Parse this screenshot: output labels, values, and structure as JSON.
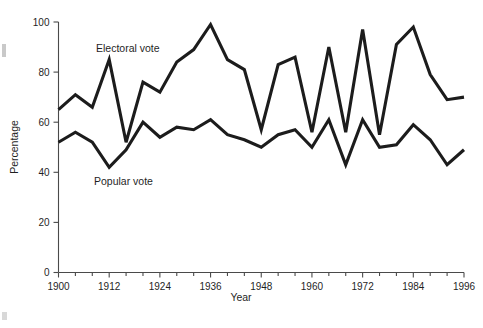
{
  "chart_data": {
    "type": "line",
    "title": "",
    "xlabel": "Year",
    "ylabel": "Percentage",
    "xlim": [
      1900,
      1996
    ],
    "ylim": [
      0,
      100
    ],
    "grid": false,
    "legend_position": "inline-annotation",
    "x": [
      1900,
      1904,
      1908,
      1912,
      1916,
      1920,
      1924,
      1928,
      1932,
      1936,
      1940,
      1944,
      1948,
      1952,
      1956,
      1960,
      1964,
      1968,
      1972,
      1976,
      1980,
      1984,
      1988,
      1992,
      1996
    ],
    "x_tick_labels": [
      "1900",
      "1912",
      "1924",
      "1936",
      "1948",
      "1960",
      "1972",
      "1984",
      "1996"
    ],
    "x_tick_values": [
      1900,
      1912,
      1924,
      1936,
      1948,
      1960,
      1972,
      1984,
      1996
    ],
    "x_minor_tick_interval": 4,
    "y_tick_labels": [
      "0",
      "20",
      "40",
      "60",
      "80",
      "100"
    ],
    "y_tick_values": [
      0,
      20,
      40,
      60,
      80,
      100
    ],
    "series": [
      {
        "name": "Electoral vote",
        "values": [
          65,
          71,
          66,
          85,
          52,
          76,
          72,
          84,
          89,
          99,
          85,
          81,
          57,
          83,
          86,
          56,
          90,
          56,
          97,
          55,
          91,
          98,
          79,
          69,
          70
        ]
      },
      {
        "name": "Popular vote",
        "values": [
          52,
          56,
          52,
          42,
          49,
          60,
          54,
          58,
          57,
          61,
          55,
          53,
          50,
          55,
          57,
          50,
          61,
          43,
          61,
          50,
          51,
          59,
          53,
          43,
          49
        ]
      }
    ],
    "annotations": [
      {
        "text": "Electoral vote",
        "series": "Electoral vote"
      },
      {
        "text": "Popular vote",
        "series": "Popular vote"
      }
    ],
    "colors": {
      "line": "#1c1c1c",
      "axis": "#4a4a4a",
      "text": "#1f1f1f",
      "background": "#ffffff"
    }
  }
}
